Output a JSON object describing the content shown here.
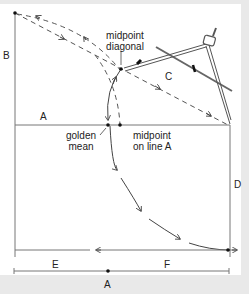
{
  "diagram": {
    "labels": {
      "B": "B",
      "A_line": "A",
      "C": "C",
      "D": "D",
      "E": "E",
      "F": "F",
      "A_bottom": "A",
      "midpoint_diagonal_1": "midpoint",
      "midpoint_diagonal_2": "diagonal",
      "golden_mean_1": "golden",
      "golden_mean_2": "mean",
      "midpoint_line_1": "midpoint",
      "midpoint_line_2": "on line A"
    },
    "colors": {
      "background": "#e9e9e9",
      "panel": "#ffffff",
      "line": "#555555",
      "text": "#222222"
    }
  }
}
